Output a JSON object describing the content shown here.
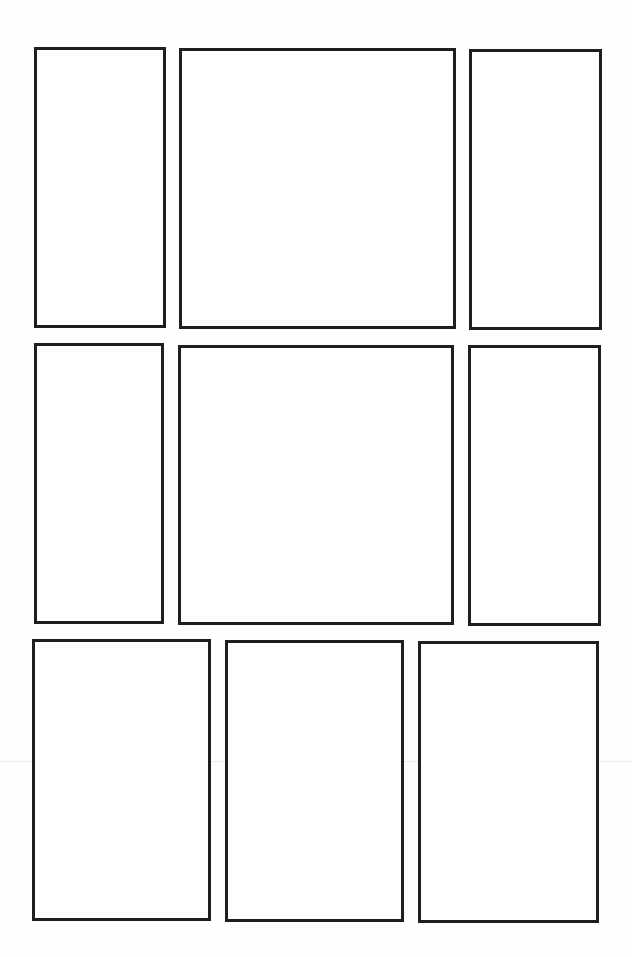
{
  "page": {
    "type": "blank-comic-page-template",
    "background": "#ffffff",
    "border_color": "#1e1e1e",
    "rows": 3,
    "panel_count": 9
  },
  "panels": [
    {
      "id": 1,
      "row": 1,
      "x": 34,
      "y": 47,
      "w": 132,
      "h": 281,
      "content": ""
    },
    {
      "id": 2,
      "row": 1,
      "x": 179,
      "y": 48,
      "w": 277,
      "h": 281,
      "content": ""
    },
    {
      "id": 3,
      "row": 1,
      "x": 469,
      "y": 49,
      "w": 133,
      "h": 281,
      "content": ""
    },
    {
      "id": 4,
      "row": 2,
      "x": 34,
      "y": 343,
      "w": 130,
      "h": 281,
      "content": ""
    },
    {
      "id": 5,
      "row": 2,
      "x": 178,
      "y": 345,
      "w": 276,
      "h": 280,
      "content": ""
    },
    {
      "id": 6,
      "row": 2,
      "x": 468,
      "y": 345,
      "w": 133,
      "h": 281,
      "content": ""
    },
    {
      "id": 7,
      "row": 3,
      "x": 32,
      "y": 639,
      "w": 179,
      "h": 282,
      "content": ""
    },
    {
      "id": 8,
      "row": 3,
      "x": 225,
      "y": 640,
      "w": 179,
      "h": 282,
      "content": ""
    },
    {
      "id": 9,
      "row": 3,
      "x": 418,
      "y": 641,
      "w": 181,
      "h": 282,
      "content": ""
    }
  ]
}
